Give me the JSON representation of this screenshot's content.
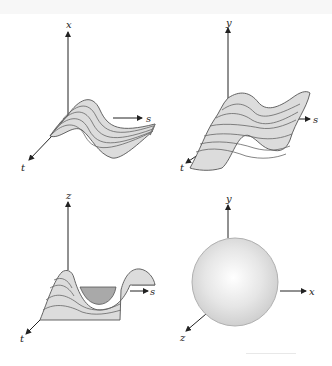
{
  "figure": {
    "panels": [
      {
        "id": "top-left",
        "description": "sinusoidal ruled surface over parameters s, t",
        "axis_labels": {
          "vertical": "x",
          "horizontal": "s",
          "depth": "t"
        }
      },
      {
        "id": "top-right",
        "description": "wavy warped surface over parameters s, t",
        "axis_labels": {
          "vertical": "y",
          "horizontal": "s",
          "depth": "t"
        }
      },
      {
        "id": "bottom-left",
        "description": "saddle-like wave surface with shaded trough",
        "axis_labels": {
          "vertical": "z",
          "horizontal": "s",
          "depth": "t"
        }
      },
      {
        "id": "bottom-right",
        "description": "shaded sphere in xyz coordinates",
        "axis_labels": {
          "vertical": "y",
          "horizontal": "x",
          "depth": "z"
        }
      }
    ],
    "colors": {
      "surface_fill": "#dcdcdc",
      "surface_dark": "#a9a9a9",
      "contour_line": "#555555",
      "axis": "#222222",
      "sphere_highlight": "#ffffff",
      "sphere_edge": "#b5b5b5"
    }
  }
}
